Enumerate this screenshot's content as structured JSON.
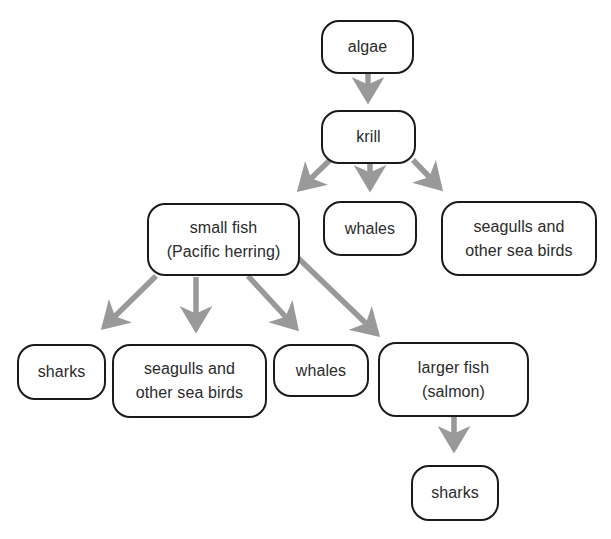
{
  "diagram": {
    "type": "food-web",
    "colors": {
      "box_border": "#1a1a1a",
      "arrow": "#999999",
      "text": "#2a2a2a",
      "background": "#ffffff"
    },
    "nodes": {
      "algae": {
        "lines": [
          "algae"
        ]
      },
      "krill": {
        "lines": [
          "krill"
        ]
      },
      "small_fish": {
        "lines": [
          "small fish",
          "(Pacific herring)"
        ]
      },
      "whales_top": {
        "lines": [
          "whales"
        ]
      },
      "seagulls_top": {
        "lines": [
          "seagulls and",
          "other sea birds"
        ]
      },
      "sharks_left": {
        "lines": [
          "sharks"
        ]
      },
      "seagulls_bottom": {
        "lines": [
          "seagulls and",
          "other sea birds"
        ]
      },
      "whales_bottom": {
        "lines": [
          "whales"
        ]
      },
      "larger_fish": {
        "lines": [
          "larger fish",
          "(salmon)"
        ]
      },
      "sharks_bottom": {
        "lines": [
          "sharks"
        ]
      }
    },
    "edges": [
      {
        "from": "algae",
        "to": "krill"
      },
      {
        "from": "krill",
        "to": "small fish (Pacific herring)"
      },
      {
        "from": "krill",
        "to": "whales"
      },
      {
        "from": "krill",
        "to": "seagulls and other sea birds"
      },
      {
        "from": "small fish (Pacific herring)",
        "to": "sharks"
      },
      {
        "from": "small fish (Pacific herring)",
        "to": "seagulls and other sea birds"
      },
      {
        "from": "small fish (Pacific herring)",
        "to": "whales"
      },
      {
        "from": "small fish (Pacific herring)",
        "to": "larger fish (salmon)"
      },
      {
        "from": "larger fish (salmon)",
        "to": "sharks"
      }
    ]
  }
}
